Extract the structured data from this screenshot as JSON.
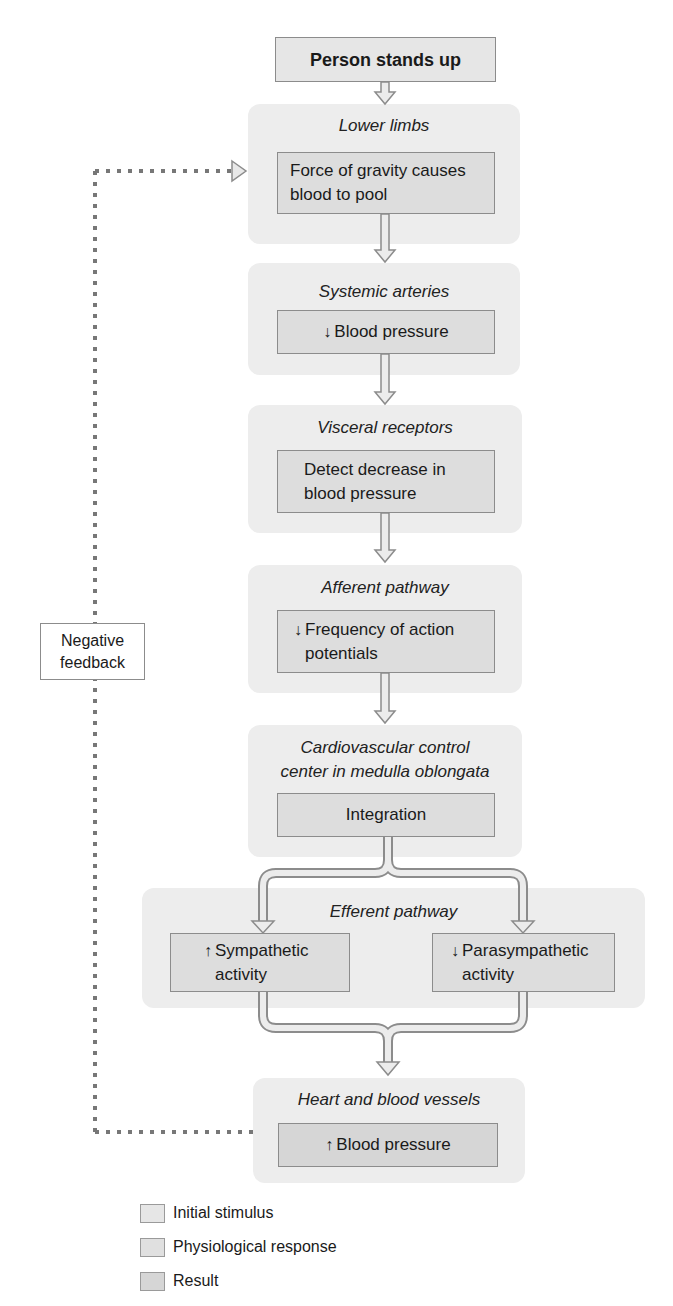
{
  "start": {
    "label": "Person stands up"
  },
  "steps": [
    {
      "location": "Lower limbs",
      "event": "Force of gravity causes blood to pool",
      "event_lines": [
        "Force of gravity causes",
        "blood to pool"
      ]
    },
    {
      "location": "Systemic arteries",
      "arrow": "↓",
      "event": "Blood pressure"
    },
    {
      "location": "Visceral receptors",
      "event_lines": [
        "Detect decrease in",
        "blood pressure"
      ]
    },
    {
      "location": "Afferent pathway",
      "arrow": "↓",
      "event_lines": [
        "Frequency of action",
        "potentials"
      ]
    },
    {
      "location_lines": [
        "Cardiovascular control",
        "center in medulla oblongata"
      ],
      "event": "Integration"
    },
    {
      "location": "Efferent pathway",
      "branches": [
        {
          "arrow": "↑",
          "event_lines": [
            "Sympathetic",
            "activity"
          ]
        },
        {
          "arrow": "↓",
          "event_lines": [
            "Parasympathetic",
            "activity"
          ]
        }
      ]
    },
    {
      "location": "Heart and blood vessels",
      "arrow": "↑",
      "event": "Blood pressure"
    }
  ],
  "feedback": {
    "lines": [
      "Negative",
      "feedback"
    ]
  },
  "legend": [
    {
      "label": "Initial stimulus",
      "color": "#e6e6e6"
    },
    {
      "label": "Physiological response",
      "color": "#e0e0e0"
    },
    {
      "label": "Result",
      "color": "#d6d6d6"
    }
  ],
  "colors": {
    "panel": "#ededed",
    "box": "#dddddd",
    "result": "#d6d6d6",
    "outline": "#8c8c8c",
    "dotted": "#777777"
  }
}
